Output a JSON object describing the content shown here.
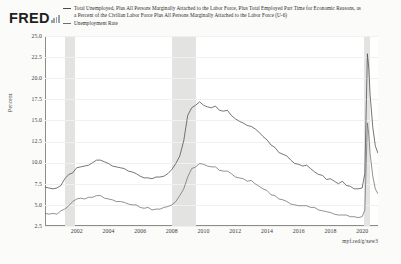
{
  "brand": {
    "logo_text": "FRED",
    "logo_icon": "bar-chart-icon"
  },
  "legend": {
    "entries": [
      {
        "label": "Total Unemployed, Plus All Persons Marginally Attached to the Labor Force, Plus Total Employed Part Time for Economic Reasons, as a Percent of the Civilian Labor Force Plus All Persons Marginally Attached to the Labor Force (U-6)",
        "color": "#4a4a4a"
      },
      {
        "label": "Unemployment Rate",
        "color": "#6e6e6e"
      }
    ]
  },
  "source": {
    "url_text": "myf.red/g/xew3"
  },
  "chart_data": {
    "type": "line",
    "title": "",
    "xlabel": "",
    "ylabel": "Percent",
    "ylim": [
      2.5,
      25.0
    ],
    "xlim": [
      2000.0,
      2021.0
    ],
    "ytick_labels": [
      "25.0",
      "22.5",
      "20.0",
      "17.5",
      "15.0",
      "12.5",
      "10.0",
      "7.5",
      "5.0",
      "2.5"
    ],
    "ytick_values": [
      25.0,
      22.5,
      20.0,
      17.5,
      15.0,
      12.5,
      10.0,
      7.5,
      5.0,
      2.5
    ],
    "xtick_labels": [
      "2002",
      "2004",
      "2006",
      "2008",
      "2010",
      "2012",
      "2014",
      "2016",
      "2018",
      "2020"
    ],
    "xtick_values": [
      2002,
      2004,
      2006,
      2008,
      2010,
      2012,
      2014,
      2016,
      2018,
      2020
    ],
    "grid": false,
    "legend_position": "top",
    "recession_bands": [
      {
        "start": 2001.25,
        "end": 2001.92
      },
      {
        "start": 2008.0,
        "end": 2009.5
      },
      {
        "start": 2020.1,
        "end": 2020.5
      }
    ],
    "series": [
      {
        "name": "U-6",
        "color": "#4a4a4a",
        "x": [
          2000.0,
          2000.25,
          2000.5,
          2000.75,
          2001.0,
          2001.25,
          2001.5,
          2001.75,
          2002.0,
          2002.25,
          2002.5,
          2002.75,
          2003.0,
          2003.25,
          2003.5,
          2003.75,
          2004.0,
          2004.25,
          2004.5,
          2004.75,
          2005.0,
          2005.25,
          2005.5,
          2005.75,
          2006.0,
          2006.25,
          2006.5,
          2006.75,
          2007.0,
          2007.25,
          2007.5,
          2007.75,
          2008.0,
          2008.25,
          2008.5,
          2008.75,
          2009.0,
          2009.25,
          2009.5,
          2009.75,
          2010.0,
          2010.25,
          2010.5,
          2010.75,
          2011.0,
          2011.25,
          2011.5,
          2011.75,
          2012.0,
          2012.25,
          2012.5,
          2012.75,
          2013.0,
          2013.25,
          2013.5,
          2013.75,
          2014.0,
          2014.25,
          2014.5,
          2014.75,
          2015.0,
          2015.25,
          2015.5,
          2015.75,
          2016.0,
          2016.25,
          2016.5,
          2016.75,
          2017.0,
          2017.25,
          2017.5,
          2017.75,
          2018.0,
          2018.25,
          2018.5,
          2018.75,
          2019.0,
          2019.25,
          2019.5,
          2019.75,
          2020.0,
          2020.17,
          2020.33,
          2020.42,
          2020.5,
          2020.67,
          2020.83,
          2021.0
        ],
        "y": [
          7.1,
          7.0,
          6.9,
          7.0,
          7.3,
          8.1,
          8.6,
          8.8,
          9.4,
          9.5,
          9.6,
          9.7,
          10.0,
          10.3,
          10.3,
          10.1,
          9.9,
          9.6,
          9.5,
          9.4,
          9.3,
          9.0,
          8.9,
          8.7,
          8.4,
          8.2,
          8.2,
          8.1,
          8.3,
          8.3,
          8.4,
          8.7,
          9.2,
          9.9,
          10.8,
          12.6,
          15.6,
          16.5,
          16.8,
          17.2,
          16.8,
          16.6,
          16.5,
          16.7,
          16.2,
          16.1,
          16.2,
          15.6,
          15.2,
          14.9,
          14.7,
          14.4,
          14.3,
          14.0,
          13.6,
          13.1,
          12.7,
          12.1,
          11.8,
          11.2,
          11.0,
          10.8,
          10.3,
          9.9,
          9.8,
          9.6,
          9.7,
          9.3,
          8.9,
          8.6,
          8.5,
          8.0,
          8.1,
          7.8,
          7.5,
          7.8,
          7.3,
          7.2,
          6.9,
          6.9,
          7.0,
          8.7,
          22.9,
          21.2,
          18.1,
          14.2,
          12.0,
          11.1
        ]
      },
      {
        "name": "Unemployment Rate",
        "color": "#6e6e6e",
        "x": [
          2000.0,
          2000.25,
          2000.5,
          2000.75,
          2001.0,
          2001.25,
          2001.5,
          2001.75,
          2002.0,
          2002.25,
          2002.5,
          2002.75,
          2003.0,
          2003.25,
          2003.5,
          2003.75,
          2004.0,
          2004.25,
          2004.5,
          2004.75,
          2005.0,
          2005.25,
          2005.5,
          2005.75,
          2006.0,
          2006.25,
          2006.5,
          2006.75,
          2007.0,
          2007.25,
          2007.5,
          2007.75,
          2008.0,
          2008.25,
          2008.5,
          2008.75,
          2009.0,
          2009.25,
          2009.5,
          2009.75,
          2010.0,
          2010.25,
          2010.5,
          2010.75,
          2011.0,
          2011.25,
          2011.5,
          2011.75,
          2012.0,
          2012.25,
          2012.5,
          2012.75,
          2013.0,
          2013.25,
          2013.5,
          2013.75,
          2014.0,
          2014.25,
          2014.5,
          2014.75,
          2015.0,
          2015.25,
          2015.5,
          2015.75,
          2016.0,
          2016.25,
          2016.5,
          2016.75,
          2017.0,
          2017.25,
          2017.5,
          2017.75,
          2018.0,
          2018.25,
          2018.5,
          2018.75,
          2019.0,
          2019.25,
          2019.5,
          2019.75,
          2020.0,
          2020.17,
          2020.33,
          2020.42,
          2020.5,
          2020.67,
          2020.83,
          2021.0
        ],
        "y": [
          4.0,
          3.9,
          4.0,
          3.9,
          4.3,
          4.5,
          4.9,
          5.4,
          5.7,
          5.8,
          5.7,
          5.9,
          5.9,
          6.1,
          6.1,
          5.8,
          5.7,
          5.6,
          5.4,
          5.4,
          5.3,
          5.1,
          5.0,
          5.0,
          4.7,
          4.6,
          4.7,
          4.4,
          4.5,
          4.5,
          4.7,
          4.8,
          5.0,
          5.4,
          6.1,
          6.9,
          8.3,
          9.3,
          9.5,
          9.9,
          9.8,
          9.6,
          9.5,
          9.5,
          9.1,
          9.0,
          9.0,
          8.7,
          8.3,
          8.2,
          8.1,
          7.8,
          7.9,
          7.5,
          7.2,
          6.9,
          6.7,
          6.2,
          6.1,
          5.7,
          5.6,
          5.4,
          5.1,
          5.0,
          4.9,
          4.9,
          4.9,
          4.7,
          4.7,
          4.4,
          4.3,
          4.2,
          4.1,
          3.9,
          3.8,
          3.8,
          3.8,
          3.6,
          3.6,
          3.5,
          3.6,
          4.4,
          14.7,
          13.3,
          11.1,
          8.4,
          6.9,
          6.3
        ]
      }
    ]
  }
}
